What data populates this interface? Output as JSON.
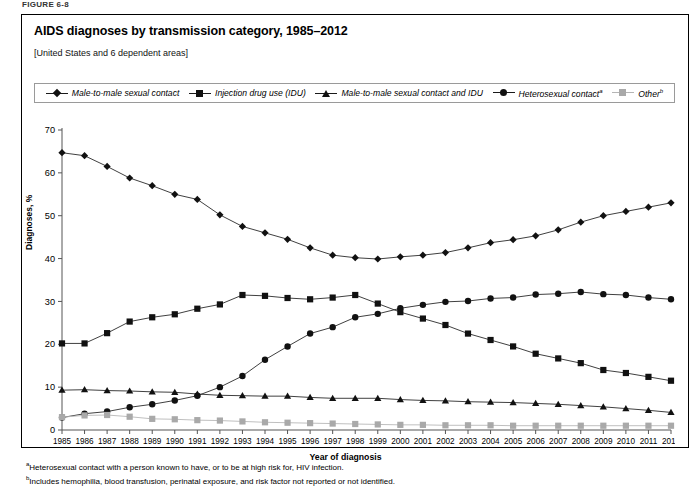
{
  "figure_label": "FIGURE 6-8",
  "title": "AIDS diagnoses by transmission category, 1985–2012",
  "subtitle": "[United States and 6 dependent areas]",
  "axis": {
    "ylabel": "Diagnoses, %",
    "xlabel": "Year of diagnosis"
  },
  "footnotes": [
    {
      "marker": "a",
      "text": "Heterosexual contact with a person known to have, or to be at high risk for, HIV infection."
    },
    {
      "marker": "b",
      "text": "Includes hemophilia, blood transfusion, perinatal exposure, and risk factor not reported or not identified."
    }
  ],
  "legend": [
    {
      "label": "Male-to-male sexual contact",
      "marker": "diamond",
      "sup": "",
      "color": "#111111"
    },
    {
      "label": "Injection drug use (IDU)",
      "marker": "square",
      "sup": "",
      "color": "#111111"
    },
    {
      "label": "Male-to-male sexual contact and IDU",
      "marker": "triangle",
      "sup": "",
      "color": "#111111"
    },
    {
      "label": "Heterosexual contact",
      "marker": "circle",
      "sup": "a",
      "color": "#111111"
    },
    {
      "label": "Other",
      "marker": "square",
      "sup": "b",
      "color": "#a9a9a9"
    }
  ],
  "chart_data": {
    "type": "line",
    "title": "AIDS diagnoses by transmission category, 1985–2012",
    "subtitle": "[United States and 6 dependent areas]",
    "xlabel": "Year of diagnosis",
    "ylabel": "Diagnoses, %",
    "grid": false,
    "legend_position": "top",
    "ylim": [
      0,
      70
    ],
    "yticks": [
      0,
      10,
      20,
      30,
      40,
      50,
      60,
      70
    ],
    "categories": [
      1985,
      1986,
      1987,
      1988,
      1989,
      1990,
      1991,
      1992,
      1993,
      1994,
      1995,
      1996,
      1997,
      1998,
      1999,
      2000,
      2001,
      2002,
      2003,
      2004,
      2005,
      2006,
      2007,
      2008,
      2009,
      2010,
      2011,
      2012
    ],
    "series": [
      {
        "name": "Male-to-male sexual contact",
        "marker": "diamond",
        "color": "#111111",
        "values": [
          64.7,
          64.0,
          61.5,
          58.8,
          57.0,
          55.0,
          53.8,
          50.2,
          47.5,
          46.0,
          44.5,
          42.5,
          40.8,
          40.2,
          39.9,
          40.4,
          40.8,
          41.4,
          42.5,
          43.7,
          44.4,
          45.3,
          46.7,
          48.5,
          50.0,
          51.0,
          52.0,
          53.0
        ]
      },
      {
        "name": "Injection drug use (IDU)",
        "marker": "square",
        "color": "#111111",
        "values": [
          20.2,
          20.2,
          22.6,
          25.3,
          26.3,
          27.0,
          28.3,
          29.3,
          31.5,
          31.3,
          30.8,
          30.5,
          30.9,
          31.5,
          29.5,
          27.5,
          26.0,
          24.5,
          22.5,
          21.0,
          19.5,
          17.8,
          16.7,
          15.6,
          14.0,
          13.3,
          12.4,
          11.5
        ]
      },
      {
        "name": "Male-to-male sexual contact and IDU",
        "marker": "triangle",
        "color": "#111111",
        "values": [
          9.3,
          9.4,
          9.2,
          9.1,
          8.9,
          8.8,
          8.4,
          8.1,
          8.0,
          7.9,
          7.9,
          7.6,
          7.4,
          7.4,
          7.4,
          7.1,
          6.9,
          6.8,
          6.6,
          6.5,
          6.4,
          6.2,
          6.0,
          5.7,
          5.4,
          5.0,
          4.6,
          4.1
        ]
      },
      {
        "name": "Heterosexual contact",
        "marker": "circle",
        "color": "#111111",
        "values": [
          2.9,
          3.8,
          4.3,
          5.3,
          6.0,
          6.9,
          8.0,
          10.0,
          12.6,
          16.4,
          19.5,
          22.5,
          24.0,
          26.3,
          27.1,
          28.4,
          29.2,
          29.9,
          30.1,
          30.7,
          30.9,
          31.6,
          31.8,
          32.2,
          31.7,
          31.5,
          30.9,
          30.5
        ]
      },
      {
        "name": "Other",
        "marker": "square",
        "color": "#a9a9a9",
        "values": [
          3.0,
          3.4,
          3.5,
          3.1,
          2.6,
          2.5,
          2.3,
          2.2,
          2.0,
          1.8,
          1.7,
          1.6,
          1.5,
          1.4,
          1.3,
          1.2,
          1.2,
          1.1,
          1.1,
          1.1,
          1.0,
          1.0,
          1.0,
          1.0,
          1.0,
          1.0,
          1.0,
          1.0
        ]
      }
    ]
  }
}
